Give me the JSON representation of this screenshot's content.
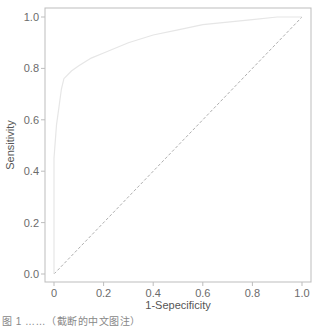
{
  "chart_data": {
    "type": "line",
    "title": "",
    "xlabel": "1-Sepecificity",
    "ylabel": "Sensitivity",
    "xlim": [
      0,
      1
    ],
    "ylim": [
      0,
      1
    ],
    "grid": false,
    "legend": null,
    "x_ticks": [
      "0",
      "0.2",
      "0.4",
      "0.6",
      "0.8",
      "1.0"
    ],
    "y_ticks": [
      "0.0",
      "0.2",
      "0.4",
      "0.6",
      "0.8",
      "1.0"
    ],
    "series": [
      {
        "name": "ROC curve",
        "color": "#e6e6e6",
        "style": "solid",
        "x": [
          0.0,
          0.0,
          0.01,
          0.02,
          0.03,
          0.04,
          0.07,
          0.1,
          0.15,
          0.2,
          0.3,
          0.4,
          0.5,
          0.6,
          0.7,
          0.8,
          0.9,
          1.0
        ],
        "y": [
          0.0,
          0.45,
          0.58,
          0.65,
          0.72,
          0.76,
          0.79,
          0.81,
          0.84,
          0.86,
          0.9,
          0.93,
          0.95,
          0.97,
          0.98,
          0.99,
          1.0,
          1.0
        ]
      },
      {
        "name": "Reference line",
        "color": "#999999",
        "style": "dashed",
        "x": [
          0,
          1
        ],
        "y": [
          0,
          1
        ]
      }
    ]
  },
  "caption": "图 1 ……（截断的中文图注）"
}
